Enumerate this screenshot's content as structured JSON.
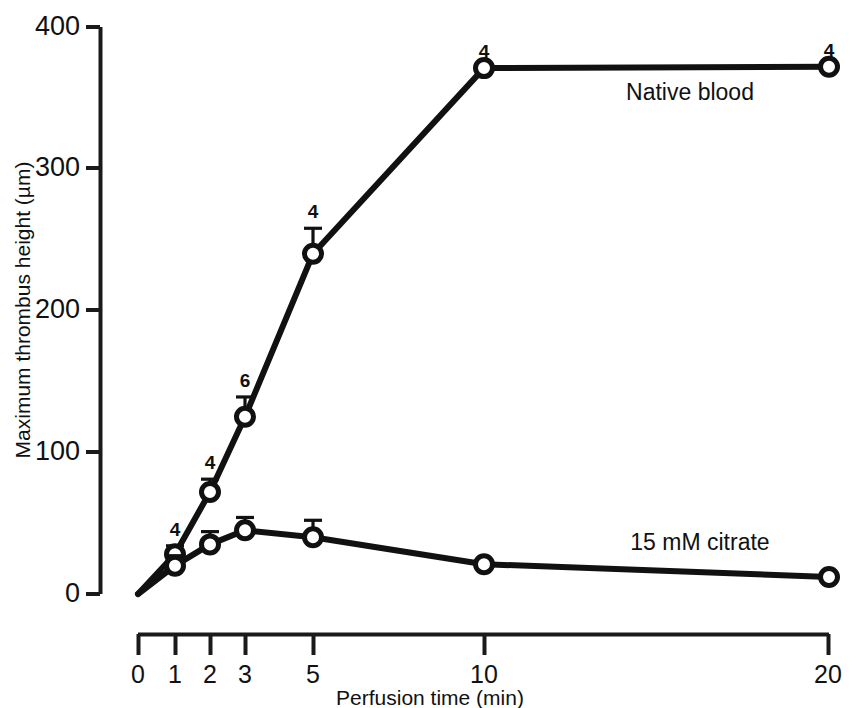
{
  "chart_data": {
    "type": "line",
    "title": "",
    "xlabel": "Perfusion time (min)",
    "ylabel": "Maximum thrombus height (µm)",
    "x": [
      0,
      1,
      2,
      3,
      5,
      10,
      20
    ],
    "xtick_labels": [
      "0",
      "1",
      "2",
      "3",
      "5",
      "10",
      "20"
    ],
    "xscale": "categorical",
    "ylim": [
      0,
      400
    ],
    "ytick_values": [
      0,
      100,
      200,
      300,
      400
    ],
    "ytick_labels": [
      "0",
      "100",
      "200",
      "300",
      "400"
    ],
    "grid": false,
    "legend_position": "inline-annotations",
    "series": [
      {
        "name": "Native blood",
        "label": "Native blood",
        "values": [
          0,
          28,
          72,
          125,
          240,
          371,
          372
        ],
        "errors": [
          0,
          6,
          9,
          14,
          18,
          0,
          0
        ],
        "n_labels": [
          "",
          "4",
          "4",
          "6",
          "4",
          "4",
          "4"
        ],
        "marker": "open-circle",
        "label_x": 5,
        "color": "#111111"
      },
      {
        "name": "15 mM citrate",
        "label": "15 mM citrate",
        "values": [
          0,
          20,
          35,
          45,
          40,
          21,
          12
        ],
        "errors": [
          0,
          7,
          9,
          9,
          12,
          0,
          0
        ],
        "n_labels": [
          "",
          "",
          "",
          "",
          "",
          "",
          ""
        ],
        "marker": "open-circle",
        "color": "#111111"
      }
    ],
    "annotations": [
      {
        "text": "Native blood",
        "x_px": 690,
        "y_px": 100
      },
      {
        "text": "15 mM citrate",
        "x_px": 700,
        "y_px": 550
      }
    ]
  },
  "axes": {
    "y_title": "Maximum thrombus height (µm)",
    "x_title": "Perfusion time (min)"
  }
}
